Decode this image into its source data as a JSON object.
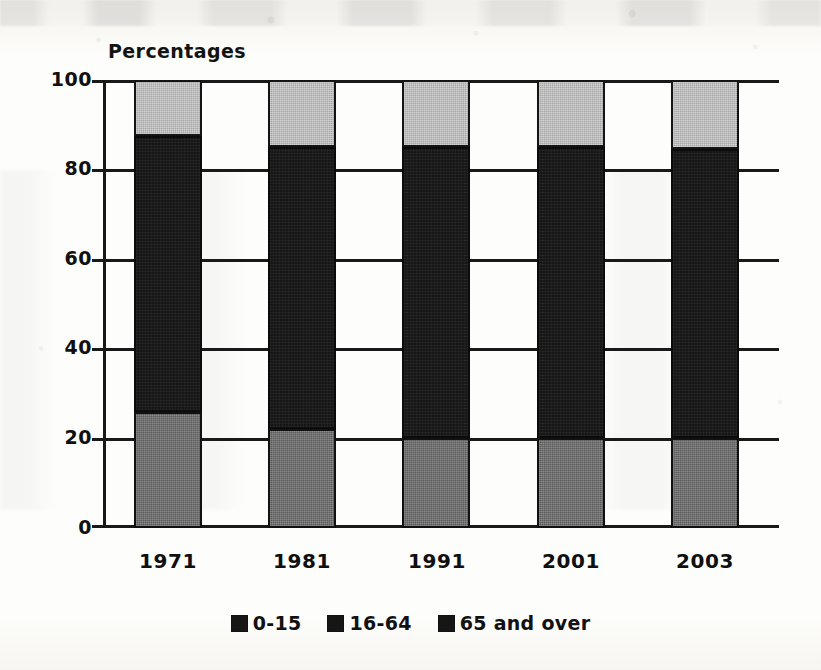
{
  "chart_data": {
    "type": "bar",
    "subtype": "stacked-bar-100",
    "title": "",
    "axis_note": "Percentages",
    "xlabel": "",
    "ylabel": "",
    "categories": [
      "1971",
      "1981",
      "1991",
      "2001",
      "2003"
    ],
    "series": [
      {
        "name": "0-15",
        "color": "#5a5a5a",
        "values": [
          26.0,
          22.0,
          20.0,
          20.0,
          20.0
        ]
      },
      {
        "name": "16-64",
        "color": "#161616",
        "values": [
          61.5,
          63.0,
          65.0,
          65.0,
          64.5
        ]
      },
      {
        "name": "65 and over",
        "color": "#a6a6a6",
        "values": [
          12.5,
          15.0,
          15.0,
          15.0,
          15.5
        ]
      }
    ],
    "cumulative_tops": {
      "0-15": [
        26.0,
        22.0,
        20.0,
        20.0,
        20.0
      ],
      "16-64": [
        87.5,
        85.0,
        85.0,
        85.0,
        84.5
      ],
      "65 and over": [
        100.0,
        100.0,
        100.0,
        100.0,
        100.0
      ]
    },
    "ylim": [
      0,
      100
    ],
    "yticks": [
      "0",
      "20",
      "40",
      "60",
      "80",
      "100"
    ],
    "ytick_values": [
      0,
      20,
      40,
      60,
      80,
      100
    ],
    "grid": "horizontal",
    "legend_position": "bottom-center",
    "legend": [
      "0-15",
      "16-64",
      "65 and over"
    ]
  },
  "axis_title": "Percentages",
  "legend": {
    "items": [
      {
        "label": "0-15"
      },
      {
        "label": "16-64"
      },
      {
        "label": "65 and over"
      }
    ]
  },
  "yticks": [
    {
      "label": "100"
    },
    {
      "label": "80"
    },
    {
      "label": "60"
    },
    {
      "label": "40"
    },
    {
      "label": "20"
    },
    {
      "label": "0"
    }
  ],
  "xticks": [
    {
      "label": "1971"
    },
    {
      "label": "1981"
    },
    {
      "label": "1991"
    },
    {
      "label": "2001"
    },
    {
      "label": "2003"
    }
  ]
}
